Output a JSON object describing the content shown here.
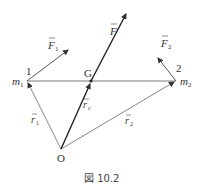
{
  "diagram": {
    "caption": "図 10.2",
    "points": {
      "m1": {
        "label": "m",
        "sub": "1",
        "number": "1"
      },
      "m2": {
        "label": "m",
        "sub": "2",
        "number": "2"
      },
      "G": {
        "label": "G"
      },
      "O": {
        "label": "O"
      }
    },
    "vectors": {
      "F": {
        "label": "F"
      },
      "F1": {
        "label": "F",
        "sub": "1"
      },
      "F2": {
        "label": "F",
        "sub": "2"
      },
      "r1": {
        "label": "r",
        "sub": "1"
      },
      "r2": {
        "label": "r",
        "sub": "2"
      },
      "rc": {
        "label": "r",
        "sub": "c"
      }
    },
    "arrow_mark": "→"
  }
}
